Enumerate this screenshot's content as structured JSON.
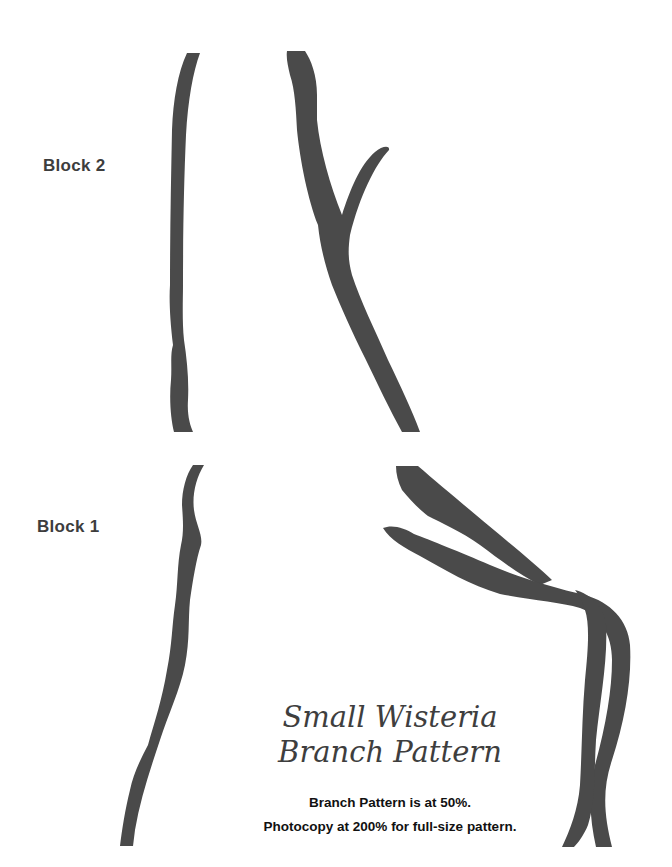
{
  "document": {
    "labels": {
      "block2": "Block 2",
      "block1": "Block 1"
    },
    "title": {
      "line1": "Small Wisteria",
      "line2": "Branch Pattern"
    },
    "notes": {
      "scale": "Branch Pattern is at 50%.",
      "photocopy": "Photocopy at 200% for full-size pattern."
    },
    "colors": {
      "branch": "#4a4a4a",
      "background": "#ffffff",
      "text": "#111111"
    }
  }
}
